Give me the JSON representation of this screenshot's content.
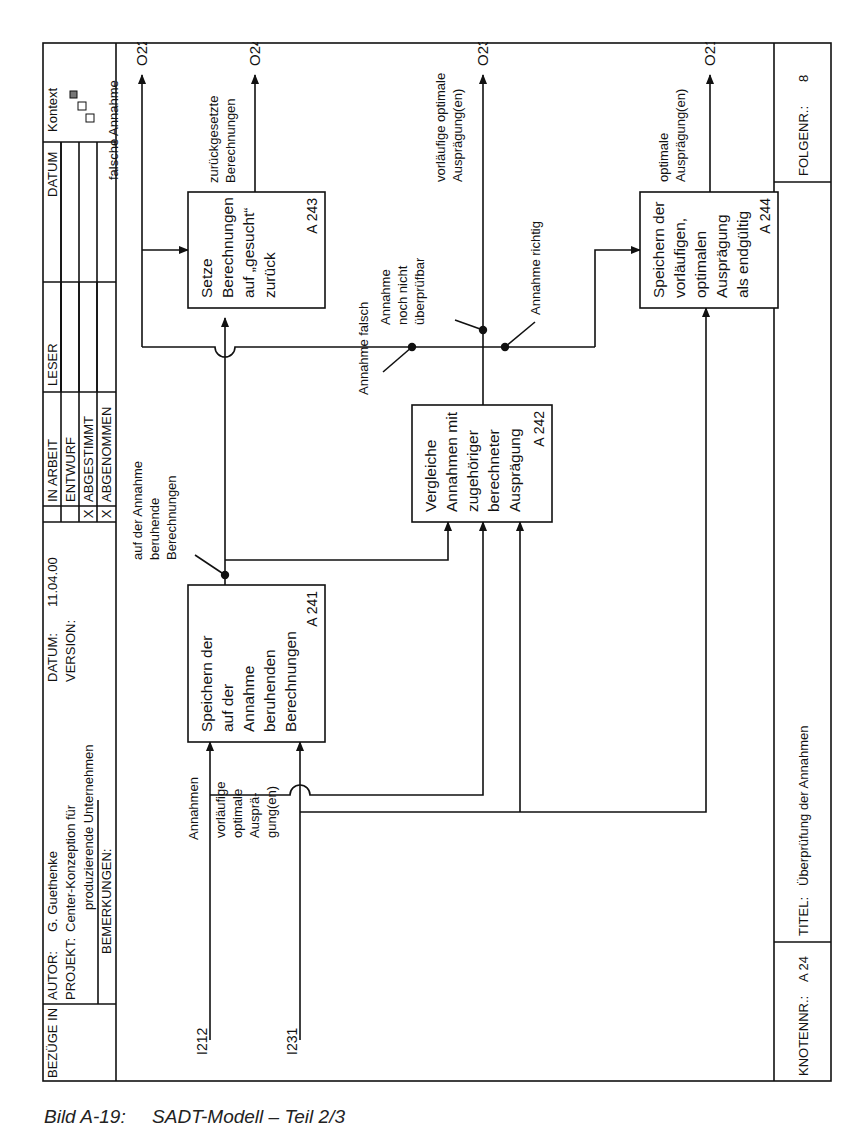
{
  "header": {
    "bezuege_in_label": "BEZÜGE IN",
    "autor_label": "AUTOR:",
    "autor_value": "G. Guethenke",
    "projekt_label": "PROJEKT:",
    "projekt_value_line1": "Center-Konzeption für",
    "projekt_value_line2": "produzierende Unternehmen",
    "bemerkungen_label": "BEMERKUNGEN:",
    "datum_label": "DATUM:",
    "datum_value": "11.04.00",
    "version_label": "VERSION:",
    "status_rows": [
      {
        "mark": "",
        "label": "IN ARBEIT"
      },
      {
        "mark": "",
        "label": "ENTWURF"
      },
      {
        "mark": "X",
        "label": "ABGESTIMMT"
      },
      {
        "mark": "X",
        "label": "ABGENOMMEN"
      }
    ],
    "leser_label": "LESER",
    "leser_datum_label": "DATUM",
    "kontext_label": "Kontext"
  },
  "footer": {
    "knotennr_label": "KNOTENNR.:",
    "knotennr_value": "A 24",
    "titel_label": "TITEL:",
    "titel_value": "Überprüfung der Annahmen",
    "folgenr_label": "FOLGENR.:",
    "folgenr_value": "8"
  },
  "activities": [
    {
      "id": "A 241",
      "lines": [
        "Speichern der",
        "auf der",
        "Annahme",
        "beruhenden",
        "Berechnungen"
      ]
    },
    {
      "id": "A 242",
      "lines": [
        "Vergleiche",
        "Annahmen mit",
        "zugehöriger",
        "berechneter",
        "Ausprägung"
      ]
    },
    {
      "id": "A 243",
      "lines": [
        "Setze",
        "Berechnungen",
        "auf „gesucht“",
        "zurück"
      ]
    },
    {
      "id": "A 244",
      "lines": [
        "Speichern der",
        "vorläufigen,",
        "optimalen",
        "Ausprägung",
        "als endgültig"
      ]
    }
  ],
  "inputs": [
    {
      "code": "I212",
      "lines": [
        "Annahmen"
      ]
    },
    {
      "code": "I231",
      "lines": [
        "vorläufige",
        "optimale",
        "Ausprä-",
        "gung(en)"
      ]
    }
  ],
  "outputs": [
    {
      "code": "O22",
      "lines": [
        "falsche Annahme"
      ]
    },
    {
      "code": "O24",
      "lines": [
        "zurückgesetzte",
        "Berechnungen"
      ]
    },
    {
      "code": "O23",
      "lines": [
        "vorläufige optimale",
        "Ausprägung(en)"
      ]
    },
    {
      "code": "O21",
      "lines": [
        "optimale",
        "Ausprägung(en)"
      ]
    }
  ],
  "flow_labels": {
    "beruhende": [
      "auf der Annahme",
      "beruhende",
      "Berechnungen"
    ],
    "falsch": [
      "Annahme falsch"
    ],
    "nicht_pruefbar": [
      "Annahme",
      "noch nicht",
      "überprüfbar"
    ],
    "richtig": [
      "Annahme richtig"
    ]
  },
  "caption": "Bild A-19:     SADT-Modell – Teil 2/3"
}
